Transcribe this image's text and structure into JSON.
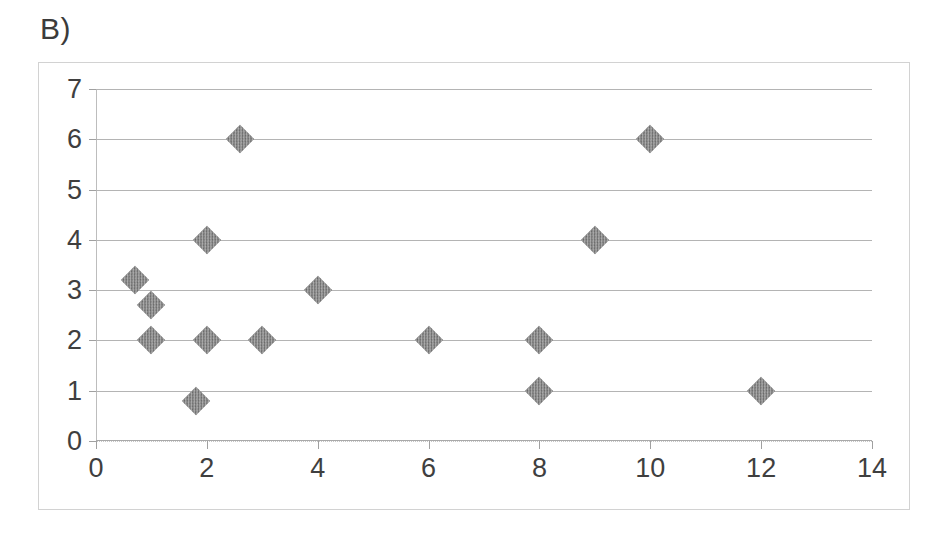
{
  "panel": {
    "label": "B)"
  },
  "colors": {
    "marker": "#7d7d7d",
    "gridline": "#b4b4b4",
    "axis": "#a9a9a9",
    "frame_border": "#d2d2d2",
    "text": "#3f3f3f"
  },
  "chart_data": {
    "type": "scatter",
    "title": "B)",
    "xlabel": "",
    "ylabel": "",
    "xlim": [
      0,
      14
    ],
    "ylim": [
      0,
      7
    ],
    "xticks": [
      0,
      2,
      4,
      6,
      8,
      10,
      12,
      14
    ],
    "yticks": [
      0,
      1,
      2,
      3,
      4,
      5,
      6,
      7
    ],
    "xtick_labels": [
      "0",
      "2",
      "4",
      "6",
      "8",
      "10",
      "12",
      "14"
    ],
    "ytick_labels": [
      "0",
      "1",
      "2",
      "3",
      "4",
      "5",
      "6",
      "7"
    ],
    "grid": true,
    "grid_axis": "y",
    "legend": false,
    "marker_style": "diamond",
    "series": [
      {
        "name": "series-1",
        "points": [
          {
            "x": 0.7,
            "y": 3.2
          },
          {
            "x": 1.0,
            "y": 2.7
          },
          {
            "x": 1.0,
            "y": 2.0
          },
          {
            "x": 1.8,
            "y": 0.8
          },
          {
            "x": 2.0,
            "y": 4.0
          },
          {
            "x": 2.0,
            "y": 2.0
          },
          {
            "x": 2.6,
            "y": 6.0
          },
          {
            "x": 3.0,
            "y": 2.0
          },
          {
            "x": 4.0,
            "y": 3.0
          },
          {
            "x": 6.0,
            "y": 2.0
          },
          {
            "x": 8.0,
            "y": 2.0
          },
          {
            "x": 8.0,
            "y": 1.0
          },
          {
            "x": 9.0,
            "y": 4.0
          },
          {
            "x": 10.0,
            "y": 6.0
          },
          {
            "x": 12.0,
            "y": 1.0
          }
        ]
      }
    ]
  }
}
